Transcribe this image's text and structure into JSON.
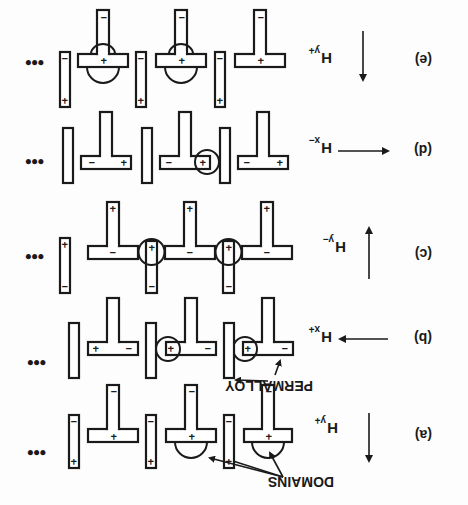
{
  "figure": {
    "orientation": "rotated-180",
    "labels": {
      "domains": "DOMAINS",
      "permalloy": "PERMALLOY",
      "ellipsis": "•••"
    },
    "rows": [
      {
        "step": "(a)",
        "field": "H",
        "field_sub": "y+",
        "arrow": "down"
      },
      {
        "step": "(b)",
        "field": "H",
        "field_sub": "x+",
        "arrow": "left"
      },
      {
        "step": "(c)",
        "field": "H",
        "field_sub": "y−",
        "arrow": "up"
      },
      {
        "step": "(d)",
        "field": "H",
        "field_sub": "x−",
        "arrow": "right"
      },
      {
        "step": "(e)",
        "field": "H",
        "field_sub": "y+",
        "arrow": "down"
      }
    ],
    "signs": {
      "plus": "+",
      "minus": "−"
    }
  }
}
